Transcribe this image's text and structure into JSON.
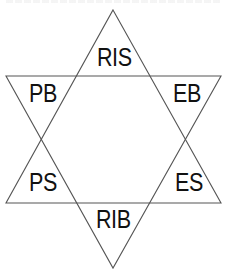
{
  "diagram": {
    "type": "hexagram",
    "stroke_color": "#555555",
    "label_color": "#111111",
    "triangles": {
      "upward": {
        "points": [
          [
            113,
            10
          ],
          [
            221,
            203
          ],
          [
            6,
            203
          ]
        ]
      },
      "downward": {
        "points": [
          [
            6,
            76
          ],
          [
            221,
            76
          ],
          [
            113,
            268
          ]
        ]
      }
    },
    "labels": {
      "top": "RIS",
      "upper_left": "PB",
      "upper_right": "EB",
      "lower_left": "PS",
      "lower_right": "ES",
      "bottom": "RIB"
    }
  }
}
